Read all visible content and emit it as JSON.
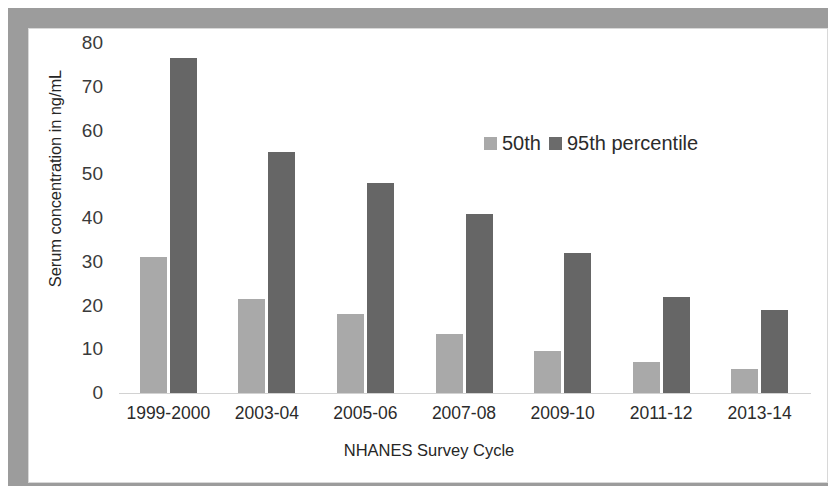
{
  "chart_data": {
    "type": "bar",
    "title": "",
    "xlabel": "NHANES Survey Cycle",
    "ylabel": "Serum concentration in ng/mL",
    "categories": [
      "1999-2000",
      "2003-04",
      "2005-06",
      "2007-08",
      "2009-10",
      "2011-12",
      "2013-14"
    ],
    "series": [
      {
        "name": "50th",
        "color": "#a9a9a9",
        "values": [
          31,
          21.5,
          18,
          13.5,
          9.5,
          7,
          5.5
        ]
      },
      {
        "name": "95th percentile",
        "color": "#666666",
        "values": [
          76.5,
          55,
          48,
          41,
          32,
          22,
          19
        ]
      }
    ],
    "ylim": [
      0,
      80
    ],
    "yticks": [
      80,
      70,
      60,
      50,
      40,
      30,
      20,
      10,
      0
    ],
    "grid": false,
    "legend_position": "upper-center"
  },
  "legend": {
    "entries": [
      {
        "label": "50th"
      },
      {
        "label": "95th percentile"
      }
    ]
  }
}
